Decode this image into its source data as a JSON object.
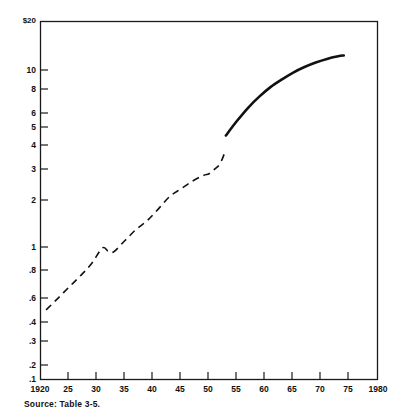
{
  "figure": {
    "source_note": "Source:  Table 3-5.",
    "top_left_label": "$20",
    "bottom_right_label": "1980"
  },
  "chart_data": {
    "type": "line",
    "title": "",
    "xlabel": "",
    "ylabel": "",
    "scale": {
      "x": "linear",
      "y": "log"
    },
    "xlim": [
      1920,
      1980
    ],
    "ylim": [
      0.1,
      20
    ],
    "grid": false,
    "legend": "none",
    "axis_frame": "box",
    "x_ticks": [
      1920,
      1925,
      1930,
      1935,
      1940,
      1945,
      1950,
      1955,
      1960,
      1965,
      1970,
      1975,
      1980
    ],
    "x_tick_labels": [
      "1920",
      "25",
      "30",
      "35",
      "40",
      "45",
      "50",
      "55",
      "60",
      "65",
      "70",
      "75",
      "1980"
    ],
    "y_ticks": [
      0.1,
      0.2,
      0.3,
      0.4,
      0.6,
      0.8,
      1,
      2,
      3,
      4,
      5,
      6,
      8,
      10,
      20
    ],
    "y_tick_labels": [
      ".1",
      ".2",
      ".3",
      ".4",
      ".6",
      ".8",
      "1",
      "2",
      "3",
      "4",
      "5",
      "6",
      "8",
      "10",
      "$20"
    ],
    "series": [
      {
        "name": "historical",
        "style": "dashed",
        "x": [
          1921,
          1923,
          1925,
          1927,
          1929,
          1931,
          1932,
          1933,
          1935,
          1937,
          1939,
          1941,
          1943,
          1945,
          1947,
          1949,
          1950,
          1951,
          1952,
          1953
        ],
        "values": [
          0.28,
          0.33,
          0.39,
          0.46,
          0.55,
          0.7,
          0.67,
          0.66,
          0.78,
          0.92,
          1.05,
          1.25,
          1.5,
          1.68,
          1.88,
          2.05,
          2.1,
          2.25,
          2.45,
          3.0
        ]
      },
      {
        "name": "projected",
        "style": "solid",
        "x": [
          1953,
          1955,
          1957,
          1959,
          1961,
          1963,
          1965,
          1967,
          1969,
          1971,
          1973,
          1974
        ],
        "values": [
          3.7,
          4.6,
          5.6,
          6.6,
          7.6,
          8.5,
          9.4,
          10.2,
          10.9,
          11.5,
          11.95,
          12.1
        ]
      }
    ]
  }
}
